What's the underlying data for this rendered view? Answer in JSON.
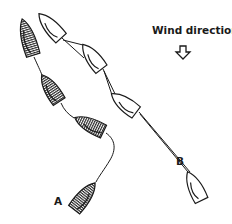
{
  "diagram": {
    "title": "Wind direction",
    "wind": {
      "label": "Wind direction",
      "icon": "down-arrow-icon",
      "direction": "down"
    },
    "colors": {
      "ink": "#1a1a1a",
      "hull_hatched_fill": "#5a5a5a",
      "hull_white_fill": "#ffffff",
      "background": "#ffffff"
    },
    "series": [
      {
        "id": "A",
        "label": "A",
        "style": "hatched",
        "path_type": "curved",
        "boats": [
          {
            "index": 1,
            "bow": [
              22,
              19
            ],
            "stern": [
              34,
              57
            ]
          },
          {
            "index": 2,
            "bow": [
              42,
              75
            ],
            "stern": [
              61,
              103
            ]
          },
          {
            "index": 3,
            "bow": [
              74,
              118
            ],
            "stern": [
              106,
              133
            ]
          },
          {
            "index": 4,
            "bow": [
              96,
              182
            ],
            "stern": [
              73,
              212
            ]
          }
        ]
      },
      {
        "id": "B",
        "label": "B",
        "style": "white",
        "path_type": "straight",
        "boats": [
          {
            "index": 1,
            "bow": [
              39,
              13
            ],
            "stern": [
              63,
              40
            ]
          },
          {
            "index": 2,
            "bow": [
              83,
              45
            ],
            "stern": [
              104,
              71
            ]
          },
          {
            "index": 3,
            "bow": [
              112,
              95
            ],
            "stern": [
              140,
              114
            ]
          },
          {
            "index": 4,
            "bow": [
              188,
              172
            ],
            "stern": [
              203,
              203
            ]
          }
        ]
      }
    ]
  }
}
